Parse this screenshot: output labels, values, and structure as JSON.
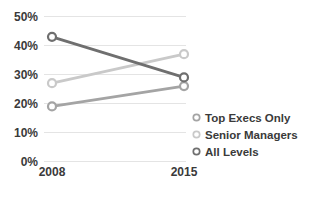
{
  "chart_data": {
    "type": "line",
    "title": "",
    "xlabel": "",
    "ylabel": "",
    "categories": [
      "2008",
      "2015"
    ],
    "series": [
      {
        "name": "Top Execs Only",
        "values": [
          19,
          26
        ],
        "color": "#a4a4a4"
      },
      {
        "name": "Senior Managers",
        "values": [
          27,
          37
        ],
        "color": "#c9c9c9"
      },
      {
        "name": "All Levels",
        "values": [
          43,
          29
        ],
        "color": "#6f6f6f"
      }
    ],
    "ylim": [
      0,
      50
    ],
    "ytick_step": 10,
    "ytick_labels": [
      "0%",
      "10%",
      "20%",
      "30%",
      "40%",
      "50%"
    ],
    "grid": true,
    "gridline_color": "#e4e4e4",
    "axis_text_color": "#3a3a3a",
    "background_color": "#ffffff",
    "legend_position": "right-bottom",
    "marker": "open-circle"
  }
}
